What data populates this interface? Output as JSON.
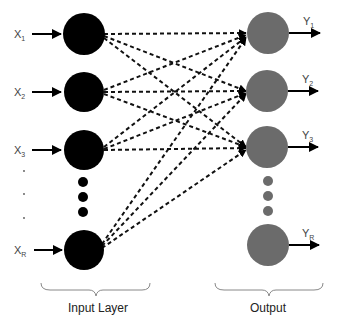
{
  "diagram": {
    "type": "neural-network",
    "input_layer": {
      "label": "Input Layer",
      "color": "#000000",
      "nodes": [
        {
          "id": "x1",
          "label": "X",
          "sub": "1",
          "cy": 34
        },
        {
          "id": "x2",
          "label": "X",
          "sub": "2",
          "cy": 92
        },
        {
          "id": "x3",
          "label": "X",
          "sub": "3",
          "cy": 150
        },
        {
          "id": "xR",
          "label": "X",
          "sub": "R",
          "cy": 250
        }
      ],
      "ellipsis_dots": 3
    },
    "output_layer": {
      "label": "Output",
      "color": "#6b6b6b",
      "nodes": [
        {
          "id": "y1",
          "label": "Y",
          "sub": "1",
          "cy": 33
        },
        {
          "id": "y2",
          "label": "Y",
          "sub": "2",
          "cy": 91
        },
        {
          "id": "y3",
          "label": "Y",
          "sub": "3",
          "cy": 147
        },
        {
          "id": "yR",
          "label": "Y",
          "sub": "R",
          "cy": 245
        }
      ],
      "ellipsis_dots": 3
    },
    "connections": "dashed arrows from each input node (X1, X2, X3, XR) to output nodes Y1, Y2, Y3"
  },
  "labels": {
    "x1": "X",
    "x1_sub": "1",
    "x2": "X",
    "x2_sub": "2",
    "x3": "X",
    "x3_sub": "3",
    "xR": "X",
    "xR_sub": "R",
    "y1": "Y",
    "y1_sub": "1",
    "y2": "Y",
    "y2_sub": "2",
    "y3": "Y",
    "y3_sub": "3",
    "yR": "Y",
    "yR_sub": "R",
    "input_caption": "Input Layer",
    "output_caption": "Output"
  }
}
